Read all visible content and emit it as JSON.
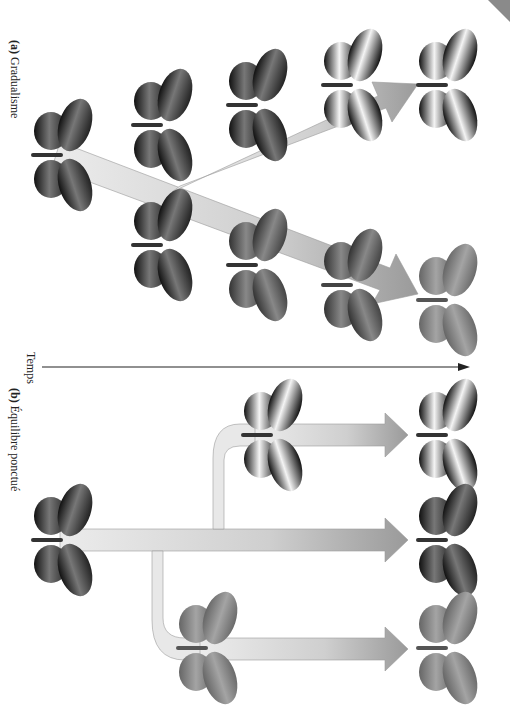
{
  "figure": {
    "panel_a": {
      "letter": "(a)",
      "title": "Gradualisme",
      "ancestor": {
        "x": 55,
        "y": 155,
        "pattern": "dark-orange"
      },
      "lineages": [
        {
          "name": "upper-branch",
          "butterflies": [
            {
              "x": 155,
              "y": 125,
              "pattern": "dark-light"
            },
            {
              "x": 250,
              "y": 105,
              "pattern": "dark-light"
            },
            {
              "x": 345,
              "y": 85,
              "pattern": "dark-white"
            },
            {
              "x": 440,
              "y": 85,
              "pattern": "dark-white"
            }
          ]
        },
        {
          "name": "lower-branch",
          "butterflies": [
            {
              "x": 155,
              "y": 245,
              "pattern": "dark-orange"
            },
            {
              "x": 250,
              "y": 265,
              "pattern": "mid-gray"
            },
            {
              "x": 345,
              "y": 285,
              "pattern": "mid-gray"
            },
            {
              "x": 440,
              "y": 300,
              "pattern": "light-gray"
            }
          ]
        }
      ]
    },
    "time_axis": {
      "label": "Temps",
      "direction": "left-to-right"
    },
    "panel_b": {
      "letter": "(b)",
      "title": "Équilibre ponctué",
      "ancestor": {
        "x": 55,
        "y": 540,
        "pattern": "dark-orange"
      },
      "lineages": [
        {
          "name": "upper-branch",
          "butterflies": [
            {
              "x": 265,
              "y": 435,
              "pattern": "dark-white"
            },
            {
              "x": 440,
              "y": 435,
              "pattern": "dark-white"
            }
          ]
        },
        {
          "name": "main-branch",
          "butterflies": [
            {
              "x": 440,
              "y": 540,
              "pattern": "dark-orange"
            }
          ]
        },
        {
          "name": "lower-branch",
          "butterflies": [
            {
              "x": 200,
              "y": 648,
              "pattern": "light-gray"
            },
            {
              "x": 440,
              "y": 648,
              "pattern": "light-gray"
            }
          ]
        }
      ]
    },
    "colors": {
      "arrow_light": "#e4e4e4",
      "arrow_dark": "#9a9a9a",
      "axis": "#222222",
      "corner": "#8a8a8a"
    }
  }
}
